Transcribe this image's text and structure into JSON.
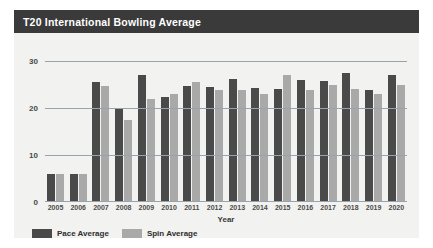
{
  "card": {
    "title": "T20 International Bowling Average"
  },
  "legend": {
    "items": [
      {
        "label": "Pace Average",
        "key": "pace",
        "color": "#4a4a4a"
      },
      {
        "label": "Spin Average",
        "key": "spin",
        "color": "#a9a9a9"
      }
    ]
  },
  "chart_data": {
    "type": "bar",
    "title": "T20 International Bowling Average",
    "xlabel": "Year",
    "ylabel": "",
    "ylim": [
      0,
      32
    ],
    "yticks": [
      0,
      10,
      20,
      30
    ],
    "grid": true,
    "legend_position": "bottom-left",
    "categories": [
      "2005",
      "2006",
      "2007",
      "2008",
      "2009",
      "2010",
      "2011",
      "2012",
      "2013",
      "2014",
      "2015",
      "2016",
      "2017",
      "2018",
      "2019",
      "2020"
    ],
    "series": [
      {
        "name": "Pace Average",
        "color": "#4a4a4a",
        "values": [
          6.0,
          6.0,
          25.5,
          20.0,
          27.0,
          22.5,
          24.8,
          24.5,
          26.3,
          24.3,
          24.2,
          26.0,
          25.8,
          27.5,
          24.0,
          27.0
        ]
      },
      {
        "name": "Spin Average",
        "color": "#a9a9a9",
        "values": [
          6.0,
          6.0,
          24.8,
          17.5,
          22.0,
          23.0,
          25.5,
          23.8,
          24.0,
          23.0,
          27.0,
          23.8,
          25.0,
          24.2,
          23.0,
          25.0
        ]
      }
    ]
  }
}
